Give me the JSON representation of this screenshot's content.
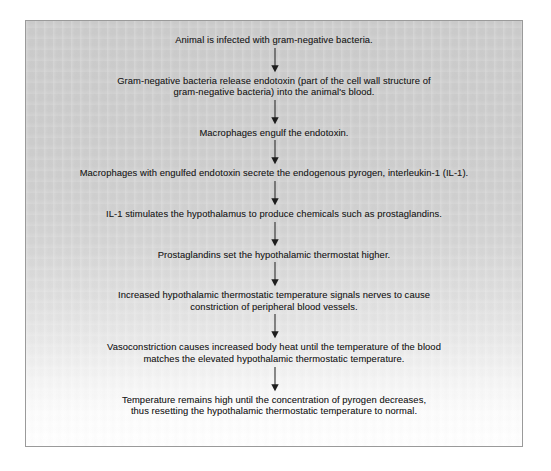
{
  "figure": {
    "kind": "flowchart",
    "orientation": "vertical",
    "title": "",
    "background_top_color": "#cccccc",
    "background_bottom_color": "#ffffff",
    "border_color": "#9a9a9a",
    "text_color": "#1f1f1f",
    "connector_icon": "down-arrow-icon",
    "steps": [
      {
        "index": 1,
        "text": "Animal is infected with gram-negative bacteria."
      },
      {
        "index": 2,
        "text": "Gram-negative bacteria release endotoxin (part of the cell wall structure of\ngram-negative bacteria) into the animal's blood."
      },
      {
        "index": 3,
        "text": "Macrophages engulf the endotoxin."
      },
      {
        "index": 4,
        "text": "Macrophages with engulfed endotoxin secrete the endogenous pyrogen, interleukin-1 (IL-1)."
      },
      {
        "index": 5,
        "text": "IL-1 stimulates the hypothalamus to produce chemicals such as prostaglandins."
      },
      {
        "index": 6,
        "text": "Prostaglandins set the hypothalamic thermostat higher."
      },
      {
        "index": 7,
        "text": "Increased hypothalamic thermostatic temperature signals nerves to cause\nconstriction of peripheral blood vessels."
      },
      {
        "index": 8,
        "text": "Vasoconstriction causes increased body heat until the temperature of the blood\nmatches the elevated hypothalamic thermostatic temperature."
      },
      {
        "index": 9,
        "text": "Temperature remains high until the concentration of pyrogen decreases,\nthus resetting the hypothalamic thermostatic temperature to normal."
      }
    ]
  }
}
